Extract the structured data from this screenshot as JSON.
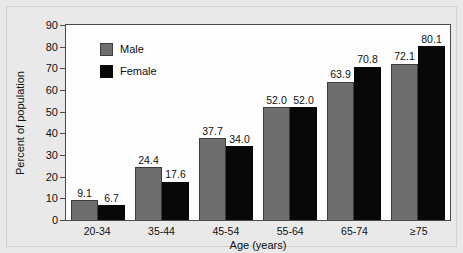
{
  "chart_data": {
    "type": "bar",
    "title": "",
    "xlabel": "Age (years)",
    "ylabel": "Percent of population",
    "categories": [
      "20-34",
      "35-44",
      "45-54",
      "55-64",
      "65-74",
      "≥75"
    ],
    "series": [
      {
        "name": "Male",
        "color": "#6e6e6e",
        "values": [
          9.1,
          24.4,
          37.7,
          52.0,
          63.9,
          72.1
        ],
        "labels": [
          "9.1",
          "24.4",
          "37.7",
          "52.0",
          "63.9",
          "72.1"
        ]
      },
      {
        "name": "Female",
        "color": "#080808",
        "values": [
          6.7,
          17.6,
          34.0,
          52.0,
          70.8,
          80.1
        ],
        "labels": [
          "6.7",
          "17.6",
          "34.0",
          "52.0",
          "70.8",
          "80.1"
        ]
      }
    ],
    "ylim": [
      0,
      90
    ],
    "yticks": [
      0,
      10,
      20,
      30,
      40,
      50,
      60,
      70,
      80,
      90
    ],
    "ytick_labels": [
      "0",
      "10",
      "20",
      "30",
      "40",
      "50",
      "60",
      "70",
      "80",
      "90"
    ],
    "grid": false,
    "legend_position": "upper-left-inside"
  },
  "legend": {
    "items": [
      {
        "label": "Male",
        "swatch": "male-swatch"
      },
      {
        "label": "Female",
        "swatch": "female-swatch"
      }
    ]
  },
  "axes": {
    "y_title": "Percent of population",
    "x_title": "Age (years)"
  }
}
